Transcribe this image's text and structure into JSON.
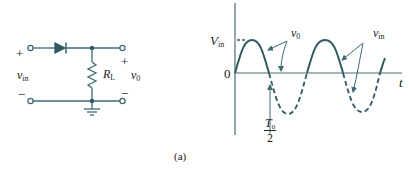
{
  "figure": {
    "caption": "(a)",
    "colors": {
      "wire": "#3d6b73",
      "waveform": "#2f5a60",
      "axis": "#4a6a70",
      "arrow": "#3d6b73",
      "text": "#1a1a1a"
    }
  },
  "circuit": {
    "input_plus": "+",
    "input_minus": "−",
    "input_label": "v",
    "input_label_sub": "in",
    "output_plus": "+",
    "output_minus": "−",
    "output_label": "v",
    "output_label_sub": "0",
    "resistor_label": "R",
    "resistor_label_sub": "L",
    "components": [
      "diode",
      "resistor",
      "ground"
    ]
  },
  "waveform": {
    "y_axis_peak_label": "V",
    "y_axis_peak_label_sub": "in",
    "origin_label": "0",
    "x_axis_label": "t",
    "half_period_num": "T",
    "half_period_num_sub": "0",
    "half_period_den": "2",
    "annotation_vo": "v",
    "annotation_vo_sub": "0",
    "annotation_vin": "v",
    "annotation_vin_sub": "in",
    "description": "Half-wave rectifier: solid positive half-cycles are v0 (output), dashed negative half-cycles are the blocked portion of vin"
  }
}
